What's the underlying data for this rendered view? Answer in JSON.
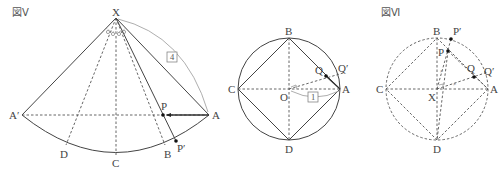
{
  "figures": [
    {
      "id": "fig5",
      "title": "図Ⅴ",
      "labels": {
        "X": "X",
        "A_prime": "A′",
        "A": "A",
        "P": "P",
        "P_prime": "P′",
        "B": "B",
        "C": "C",
        "D": "D"
      },
      "boxed_label": "4",
      "description": "Unfolded cone sector with apex X, arc from A′ to A through D, C, B; point P on segment A′A moving toward A, P′ on arc"
    },
    {
      "id": "circle-base",
      "title": "",
      "labels": {
        "B": "B",
        "C": "C",
        "D": "D",
        "A": "A",
        "O": "O",
        "Q": "Q",
        "Q_prime": "Q′"
      },
      "boxed_label": "1",
      "description": "Circle with center O, inscribed square ABCD, Q on AB, Q′ on circle"
    },
    {
      "id": "fig6",
      "title": "図Ⅵ",
      "labels": {
        "B": "B",
        "C": "C",
        "D": "D",
        "A": "A",
        "X": "X",
        "P": "P",
        "P_prime": "P′",
        "Q": "Q",
        "Q_prime": "Q′"
      },
      "description": "Dashed circle with center X, inscribed dashed square ABCD, points P, P′, Q, Q′"
    }
  ],
  "colors": {
    "line": "#444444",
    "dashed": "#555555",
    "arc_label": "#999999",
    "text": "#444444"
  }
}
